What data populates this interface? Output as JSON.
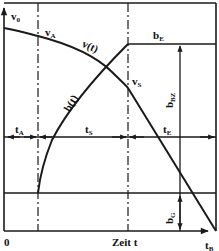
{
  "diagram": {
    "type": "braking-time-diagram",
    "x_axis": {
      "origin_label": "0",
      "label": "Zeit t",
      "end_label_main": "t",
      "end_label_sub": "B"
    },
    "curves": [
      {
        "name": "velocity",
        "label_main": "v(t)",
        "label_sub": ""
      },
      {
        "name": "deceleration",
        "label_main": "b(t)",
        "label_sub": ""
      }
    ],
    "points": {
      "v0": {
        "main": "v",
        "sub": "0"
      },
      "vA": {
        "main": "v",
        "sub": "A"
      },
      "vS": {
        "main": "v",
        "sub": "S"
      }
    },
    "levels": {
      "bE": {
        "main": "b",
        "sub": "E"
      },
      "bBZ": {
        "main": "b",
        "sub": "BZ"
      },
      "bG": {
        "main": "b",
        "sub": "G"
      }
    },
    "intervals": {
      "tA": {
        "main": "t",
        "sub": "A"
      },
      "tS": {
        "main": "t",
        "sub": "S"
      },
      "tE": {
        "main": "t",
        "sub": "E"
      }
    },
    "colors": {
      "line": "#1a1a1a",
      "background": "#ffffff"
    }
  }
}
